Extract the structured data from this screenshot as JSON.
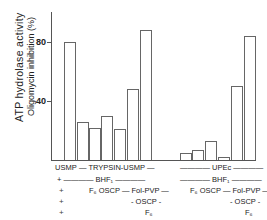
{
  "chart_data": {
    "type": "bar",
    "title": "",
    "ylabel": "ATP hydrolase activity",
    "ylabel2": "Oligomycin inhibition (%)",
    "xlabel": "",
    "ylim": [
      0,
      100
    ],
    "yticks": [
      "80",
      "40"
    ],
    "grid": false,
    "groups": [
      {
        "name": "USMP / TRYPSIN-USMP",
        "values": [
          80,
          26,
          22,
          30,
          21,
          48,
          88
        ]
      },
      {
        "name": "UPEc",
        "values": [
          5,
          7,
          13,
          2,
          50,
          84
        ]
      }
    ],
    "condition_rows": [
      {
        "left": "USMP",
        "mid": "TRYPSIN-USMP",
        "right": "UPEc"
      },
      {
        "left": "+",
        "mid": "BHF1",
        "right": "BHF1"
      },
      {
        "left": "+",
        "mid": "F6 OSCP — Fol-PVP",
        "right": "F6 OSCP — Fol-PVP"
      },
      {
        "left": "+",
        "mid": "OSCP",
        "right": "OSCP"
      },
      {
        "left": "+",
        "mid": "F6",
        "right": "F6"
      }
    ]
  },
  "labels": {
    "y1": "ATP hydrolase activity",
    "y2": "Oligomycin inhibition (%)",
    "t80": "80",
    "t40": "40",
    "usmp": "USMP",
    "trypsin": "— TRYPSIN-USMP —",
    "upec": "———— UPEc ————",
    "bhf_l": "+ ———— BHF₁ ————",
    "bhf_r": "———— BHF₁ ————",
    "f6oscp": "F₆ OSCP — Fol-PVP —",
    "oscp": "- OSCP -",
    "f6": "F₆",
    "plus": "+"
  }
}
